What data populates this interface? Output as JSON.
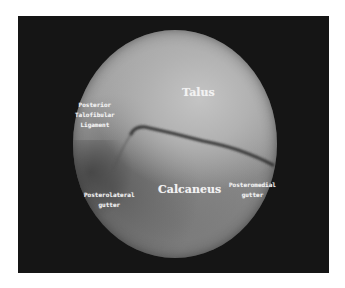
{
  "image": {
    "type": "arthroscopic-view",
    "frame_color": "#151515",
    "background_color": "#ffffff",
    "scope_tone_light": "#c4c4c4",
    "scope_tone_dark": "#5e5e5e"
  },
  "labels": {
    "talus": {
      "text": "Talus"
    },
    "calcaneus": {
      "text": "Calcaneus"
    },
    "ptfl": {
      "lines": [
        "Posterior",
        "Talofibular",
        "Ligament"
      ]
    },
    "posterolateral": {
      "lines": [
        "Posterolateral",
        "gutter"
      ]
    },
    "posteromedial": {
      "lines": [
        "Posteromedial",
        "gutter"
      ]
    }
  }
}
